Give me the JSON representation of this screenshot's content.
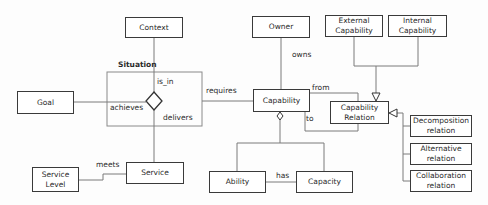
{
  "diagram": {
    "entities": {
      "context": "Context",
      "goal": "Goal",
      "service": "Service",
      "service_level": "Service Level",
      "owner": "Owner",
      "capability": "Capability",
      "external_capability": "External Capability",
      "internal_capability": "Internal Capability",
      "capability_relation": "Capability Relation",
      "decomposition_relation": "Decomposition relation",
      "alternative_relation": "Alternative relation",
      "collaboration_relation": "Collaboration relation",
      "ability": "Ability",
      "capacity": "Capacity"
    },
    "group_label": "Situation",
    "relations": {
      "is_in": "is_in",
      "achieves": "achieves",
      "delivers": "delivers",
      "requires": "requires",
      "meets": "meets",
      "owns": "owns",
      "from": "from",
      "to": "to",
      "has": "has"
    },
    "colors": {
      "line": "#7a7a7a",
      "border": "#3a3a3a",
      "background": "#ffffff"
    }
  }
}
